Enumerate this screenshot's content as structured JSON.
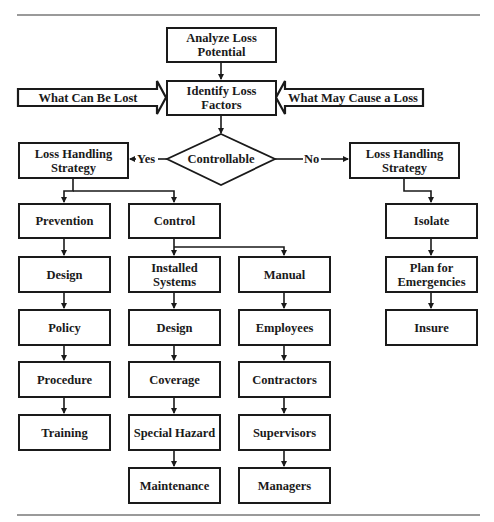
{
  "diagram": {
    "type": "flowchart",
    "top": {
      "analyze": "Analyze Loss\nPotential",
      "identify": "Identify Loss\nFactors",
      "input_left": "What Can Be Lost",
      "input_right": "What May Cause a Loss"
    },
    "decision": {
      "label": "Controllable",
      "yes_label": "Yes",
      "no_label": "No"
    },
    "yes_branch": {
      "strategy": "Loss Handling\nStrategy",
      "prevention": {
        "title": "Prevention",
        "steps": [
          "Design",
          "Policy",
          "Procedure",
          "Training"
        ]
      },
      "control": {
        "title": "Control",
        "installed_systems": {
          "title": "Installed\nSystems",
          "steps": [
            "Design",
            "Coverage",
            "Special Hazard",
            "Maintenance"
          ]
        },
        "manual": {
          "title": "Manual",
          "steps": [
            "Employees",
            "Contractors",
            "Supervisors",
            "Managers"
          ]
        }
      }
    },
    "no_branch": {
      "strategy": "Loss Handling\nStrategy",
      "steps": [
        "Isolate",
        "Plan for\nEmergencies",
        "Insure"
      ]
    },
    "colors": {
      "stroke": "#1a1a1a",
      "rule": "#9a9a9a",
      "background": "#ffffff"
    }
  }
}
